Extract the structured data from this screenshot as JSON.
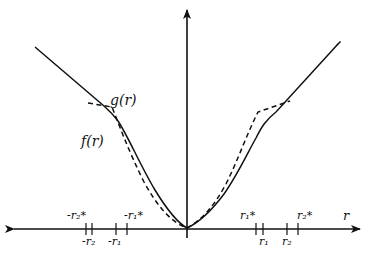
{
  "figure": {
    "axis": {
      "horizontal_label": "r",
      "vertical_label": ""
    },
    "curves": [
      {
        "name": "f(r)",
        "label": "f(r)",
        "style": "solid"
      },
      {
        "name": "g(r)",
        "label": "g(r)",
        "style": "dashed"
      }
    ],
    "ticks_above": {
      "neg_r2_star": "-r₂*",
      "neg_r1_star": "-r₁*",
      "r1_star": "r₁*",
      "r2_star": "r₂*"
    },
    "ticks_below": {
      "neg_r2": "-r₂",
      "neg_r1": "-r₁",
      "r1": "r₁",
      "r2": "r₂"
    },
    "colors": {
      "stroke": "#111111",
      "background": "#ffffff"
    }
  }
}
